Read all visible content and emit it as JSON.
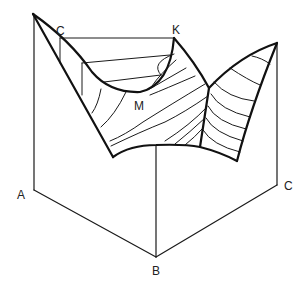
{
  "figure": {
    "type": "phase-diagram-surface",
    "labels": {
      "top_left": "C",
      "top_right": "K",
      "minimum": "M",
      "base_left": "A",
      "base_front": "B",
      "base_right": "C"
    },
    "colors": {
      "line": "#111111",
      "background": "#ffffff"
    }
  }
}
